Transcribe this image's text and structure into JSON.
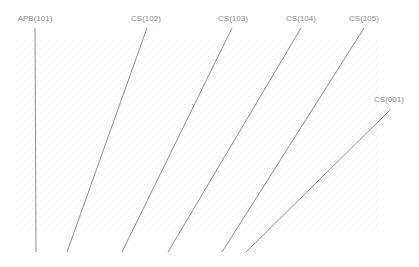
{
  "diagram": {
    "type": "angled-line-layout",
    "background": "#ffffff",
    "line_color": "#8f8f8f",
    "label_color": "#8a8a8a",
    "texture_region": {
      "x": 15,
      "y": 40,
      "width": 365,
      "height": 192
    },
    "lines": [
      {
        "label": "APB(101)",
        "x1": 35,
        "y1": 28,
        "x2": 36,
        "y2": 252,
        "label_x": 35,
        "label_y": 21
      },
      {
        "label": "CS(102)",
        "x1": 147,
        "y1": 28,
        "x2": 67,
        "y2": 252,
        "label_x": 146,
        "label_y": 21
      },
      {
        "label": "CS(103)",
        "x1": 232,
        "y1": 28,
        "x2": 122,
        "y2": 252,
        "label_x": 233,
        "label_y": 21
      },
      {
        "label": "CS(104)",
        "x1": 301,
        "y1": 28,
        "x2": 168,
        "y2": 252,
        "label_x": 301,
        "label_y": 21
      },
      {
        "label": "CS(105)",
        "x1": 364,
        "y1": 28,
        "x2": 222,
        "y2": 252,
        "label_x": 364,
        "label_y": 21
      },
      {
        "label": "CS(001)",
        "x1": 390,
        "y1": 110,
        "x2": 246,
        "y2": 252,
        "label_x": 389,
        "label_y": 102
      }
    ]
  }
}
